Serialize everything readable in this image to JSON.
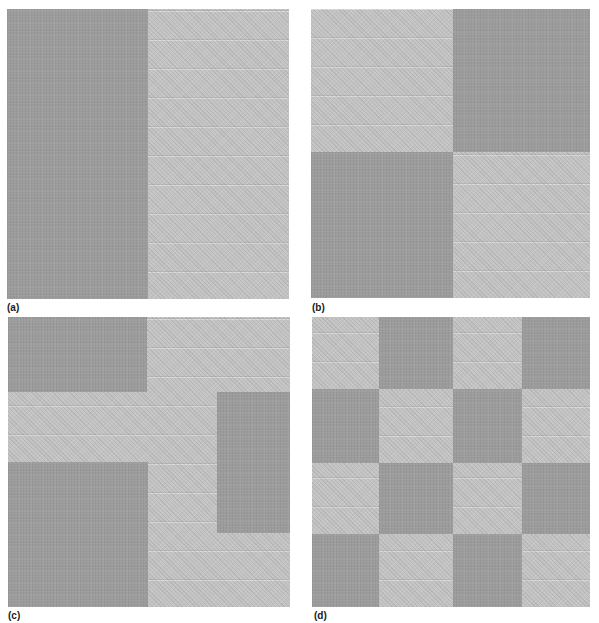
{
  "figure": {
    "colors": {
      "dark": "#9b9b9b",
      "light": "#c3c3c3",
      "background": "#ffffff"
    },
    "panels": [
      {
        "id": "a",
        "label": "(a)",
        "description": "Two-region texture: dark left half, light right half"
      },
      {
        "id": "b",
        "label": "(b)",
        "description": "2x2 checkerboard of textures: light top-left, dark top-right, dark bottom-left, light bottom-right"
      },
      {
        "id": "c",
        "label": "(c)",
        "description": "Irregular texture regions: dark top-left, dark middle-right, dark bottom-left blocks on a light background"
      },
      {
        "id": "d",
        "label": "(d)",
        "description": "4x4 checkerboard of dark and light textures, starting light at top-left"
      }
    ]
  }
}
